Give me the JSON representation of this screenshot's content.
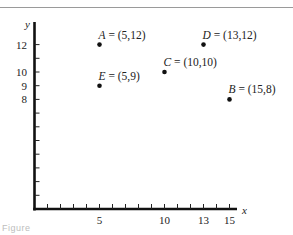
{
  "chart_data": {
    "type": "scatter",
    "title": "",
    "xlabel": "x",
    "ylabel": "y",
    "xlim": [
      0,
      15
    ],
    "ylim": [
      0,
      13.5
    ],
    "grid": false,
    "x_tick_labels": [
      "5",
      "10",
      "13",
      "15"
    ],
    "x_tick_values": [
      5,
      10,
      13,
      15
    ],
    "x_minor_ticks": [
      1,
      2,
      3,
      4,
      5,
      6,
      7,
      8,
      9,
      10,
      11,
      12,
      13,
      14,
      15
    ],
    "y_tick_labels": [
      "8",
      "9",
      "10",
      "12"
    ],
    "y_tick_values": [
      8,
      9,
      10,
      12
    ],
    "y_minor_ticks": [
      1,
      2,
      3,
      4,
      5,
      6,
      7,
      8,
      9,
      10,
      11,
      12
    ],
    "points": [
      {
        "name": "A",
        "label": "= (5,12)",
        "x": 5,
        "y": 12
      },
      {
        "name": "B",
        "label": "= (15,8)",
        "x": 15,
        "y": 8
      },
      {
        "name": "C",
        "label": "= (10,10)",
        "x": 10,
        "y": 10
      },
      {
        "name": "D",
        "label": "= (13,12)",
        "x": 13,
        "y": 12
      },
      {
        "name": "E",
        "label": "= (5,9)",
        "x": 5,
        "y": 9
      }
    ]
  },
  "caption": "Figure"
}
